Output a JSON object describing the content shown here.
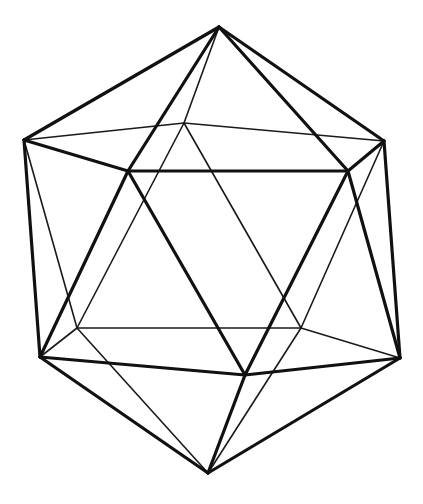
{
  "figure": {
    "colors": {
      "background": "#ffffff",
      "line": "#111111"
    },
    "vertices": {
      "T": [
        219,
        27
      ],
      "L": [
        24,
        140
      ],
      "K": [
        184,
        123
      ],
      "R": [
        384,
        141
      ],
      "A": [
        128,
        171
      ],
      "B": [
        348,
        171
      ],
      "BL": [
        77,
        328
      ],
      "BR": [
        301,
        328
      ],
      "LL": [
        40,
        357
      ],
      "C": [
        245,
        375
      ],
      "RL": [
        400,
        358
      ],
      "Bot": [
        208,
        473
      ]
    },
    "front_edges": [
      [
        "T",
        "L"
      ],
      [
        "T",
        "A"
      ],
      [
        "T",
        "B"
      ],
      [
        "T",
        "R"
      ],
      [
        "L",
        "A"
      ],
      [
        "A",
        "B"
      ],
      [
        "B",
        "R"
      ],
      [
        "L",
        "LL"
      ],
      [
        "A",
        "LL"
      ],
      [
        "A",
        "C"
      ],
      [
        "B",
        "C"
      ],
      [
        "B",
        "RL"
      ],
      [
        "R",
        "RL"
      ],
      [
        "LL",
        "C"
      ],
      [
        "C",
        "RL"
      ],
      [
        "Bot",
        "LL"
      ],
      [
        "Bot",
        "C"
      ],
      [
        "Bot",
        "RL"
      ]
    ],
    "hidden_edges": [
      [
        "T",
        "K"
      ],
      [
        "L",
        "K"
      ],
      [
        "K",
        "R"
      ],
      [
        "L",
        "BL"
      ],
      [
        "K",
        "BL"
      ],
      [
        "K",
        "BR"
      ],
      [
        "R",
        "BR"
      ],
      [
        "LL",
        "BL"
      ],
      [
        "BL",
        "BR"
      ],
      [
        "BR",
        "RL"
      ],
      [
        "Bot",
        "BL"
      ],
      [
        "Bot",
        "BR"
      ]
    ]
  }
}
